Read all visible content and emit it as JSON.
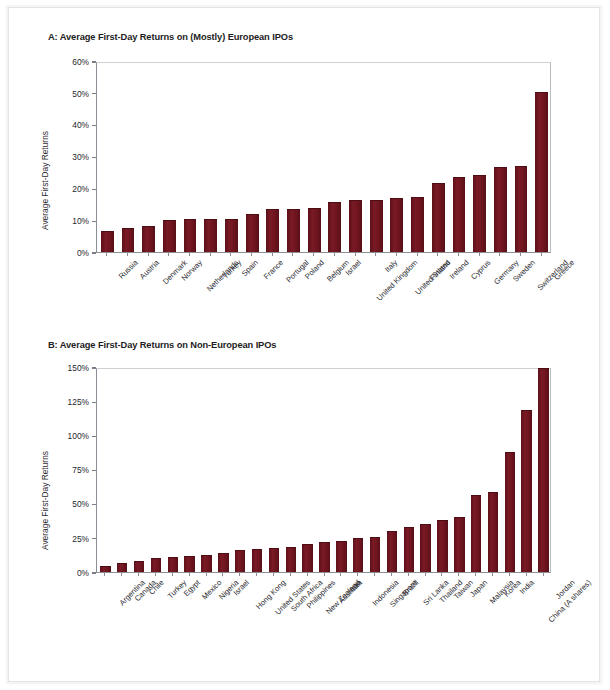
{
  "figure": {
    "background_color": "#ffffff",
    "bar_color": "#6d141e",
    "axis_color": "#8d8d95"
  },
  "panel_a": {
    "title": "A: Average First-Day Returns on (Mostly) European IPOs",
    "ylabel": "Average First-Day Returns"
  },
  "panel_b": {
    "title": "B: Average First-Day Returns on Non-European IPOs",
    "ylabel": "Average First-Day Returns"
  },
  "chart_data": [
    {
      "type": "bar",
      "id": "panel-a",
      "title": "A: Average First-Day Returns on (Mostly) European IPOs",
      "xlabel": "",
      "ylabel": "Average First-Day Returns",
      "ylim": [
        0,
        60
      ],
      "ytick_values": [
        0,
        10,
        20,
        30,
        40,
        50,
        60
      ],
      "ytick_labels": [
        "0%",
        "10%",
        "20%",
        "30%",
        "40%",
        "50%",
        "60%"
      ],
      "grid": false,
      "legend": "none",
      "bar_color": "#6d141e",
      "value_unit": "percent",
      "categories": [
        "Russia",
        "Austria",
        "Denmark",
        "Norway",
        "Netherlands",
        "Turkey",
        "Spain",
        "France",
        "Portugal",
        "Poland",
        "Belgium",
        "Israel",
        "United Kingdom",
        "Italy",
        "United States",
        "Finland",
        "Ireland",
        "Cyprus",
        "Germany",
        "Sweden",
        "Switzerland",
        "Greece"
      ],
      "values": [
        6.5,
        7.5,
        8.1,
        10.2,
        10.4,
        10.4,
        10.5,
        12.0,
        13.4,
        13.6,
        13.8,
        15.8,
        16.2,
        16.3,
        17.1,
        17.2,
        21.8,
        23.5,
        24.3,
        26.7,
        27.0,
        50.4
      ]
    },
    {
      "type": "bar",
      "id": "panel-b",
      "title": "B: Average First-Day Returns on Non-European IPOs",
      "xlabel": "",
      "ylabel": "Average First-Day Returns",
      "ylim": [
        0,
        150
      ],
      "ytick_values": [
        0,
        25,
        50,
        75,
        100,
        125,
        150
      ],
      "ytick_labels": [
        "0%",
        "25%",
        "50%",
        "75%",
        "100%",
        "125%",
        "150%"
      ],
      "grid": false,
      "legend": "none",
      "bar_color": "#6d141e",
      "value_unit": "percent",
      "categories": [
        "Argentina",
        "Canada",
        "Chile",
        "Turkey",
        "Egypt",
        "Mexico",
        "Nigeria",
        "Israel",
        "Hong Kong",
        "United States",
        "South Africa",
        "Philippines",
        "New Zealand",
        "Australia",
        "Iran",
        "Indonesia",
        "Singapore",
        "Brazil",
        "Sri Lanka",
        "Thailand",
        "Taiwan",
        "Japan",
        "Malaysia",
        "Korea",
        "India",
        "China (A shares)",
        "Jordan"
      ],
      "values": [
        4.2,
        6.5,
        8.4,
        10.4,
        10.8,
        11.6,
        12.7,
        13.8,
        15.8,
        16.9,
        17.4,
        18.1,
        20.3,
        21.8,
        22.4,
        24.9,
        25.8,
        30.2,
        33.1,
        35.1,
        38.1,
        40.2,
        56.2,
        58.8,
        88.0,
        118.4,
        149.0
      ]
    }
  ]
}
